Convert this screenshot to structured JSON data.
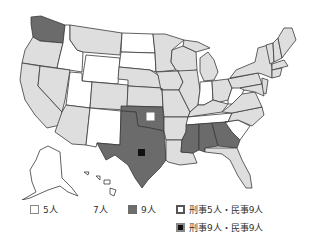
{
  "colors": {
    "five": "#ffffff",
    "seven": "#dedede",
    "nine": "#6b6b6b",
    "border": "#3a3a3a",
    "marker_dark": "#111111"
  },
  "map": {
    "states_five": [
      "Idaho",
      "Wyoming",
      "North Dakota",
      "South Dakota",
      "Utah",
      "New Mexico",
      "Indiana",
      "West Virginia",
      "Tennessee",
      "South Carolina"
    ],
    "states_nine": [
      "Washington",
      "Oklahoma",
      "Texas",
      "Mississippi",
      "Alabama",
      "Georgia"
    ],
    "markers": [
      {
        "state": "Oklahoma",
        "type": "criminal5_civil9"
      },
      {
        "state": "Texas",
        "type": "criminal9_civil9"
      }
    ]
  },
  "legend": {
    "five": "5人",
    "seven": "7人",
    "nine": "9人",
    "mixed_a": "刑事5人・民事9人",
    "mixed_b": "刑事9人・民事9人"
  }
}
